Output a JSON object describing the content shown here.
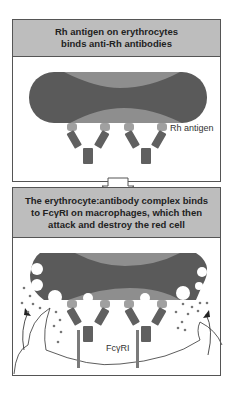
{
  "panels": [
    {
      "title_lines": [
        "Rh antigen on erythrocytes",
        "binds anti-Rh antibodies"
      ],
      "labels": {
        "antigen": "Rh antigen"
      }
    },
    {
      "title_lines": [
        "The erythrocyte:antibody complex binds",
        "to FcγRI on macrophages, which then",
        "attack and destroy the red cell"
      ],
      "labels": {
        "receptor": "FcγRI"
      }
    }
  ],
  "colors": {
    "cell_dark": "#5a5a5a",
    "cell_light": "#8e8e8e",
    "antibody": "#606060",
    "antigen": "#a0a0a0",
    "receptor": "#7a7a7a",
    "header_bg": "#bdbdbd"
  }
}
